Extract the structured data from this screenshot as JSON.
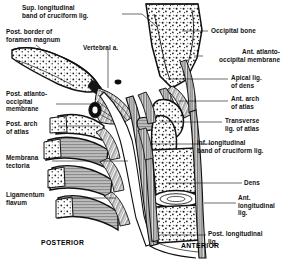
{
  "figure": {
    "orientation": {
      "posterior": "POSTERIOR",
      "anterior": "ANTERIOR"
    },
    "ink_color": "#111111",
    "background_color": "#ffffff"
  },
  "labels_left": [
    {
      "id": "sup-longitudinal-band",
      "text": "Sup. longitudinal\nband of cruciform lig.",
      "x": 22,
      "y": 5,
      "align": "left"
    },
    {
      "id": "post-border-foramen-magnum",
      "text": "Post. border of\nforamen magnum",
      "x": 6,
      "y": 29,
      "align": "left"
    },
    {
      "id": "vertebral-artery",
      "text": "Vertebral a.",
      "x": 83,
      "y": 45,
      "align": "left"
    },
    {
      "id": "post-atlanto-occipital-membrane",
      "text": "Post. atlanto-\noccipital\nmembrane",
      "x": 6,
      "y": 91,
      "align": "left"
    },
    {
      "id": "post-arch-of-atlas",
      "text": "Post. arch\nof atlas",
      "x": 6,
      "y": 121,
      "align": "left"
    },
    {
      "id": "membrana-tectoria",
      "text": "Membrana\ntectoria",
      "x": 6,
      "y": 155,
      "align": "left"
    },
    {
      "id": "ligamentum-flavum",
      "text": "Ligamentum\nflavum",
      "x": 6,
      "y": 192,
      "align": "left"
    }
  ],
  "labels_right": [
    {
      "id": "occipital-bone",
      "text": "Occipital bone",
      "x": 211,
      "y": 27,
      "align": "left"
    },
    {
      "id": "ant-atlanto-occipital-membrane",
      "text": "Ant. atlanto-\noccipital membrane",
      "x": 200,
      "y": 49,
      "align": "right"
    },
    {
      "id": "apical-lig-of-dens",
      "text": "Apical lig.\nof dens",
      "x": 231,
      "y": 75,
      "align": "left"
    },
    {
      "id": "ant-arch-of-atlas",
      "text": "Ant. arch\nof atlas",
      "x": 231,
      "y": 96,
      "align": "left"
    },
    {
      "id": "transverse-lig-of-atlas",
      "text": "Transverse\nlig. of atlas",
      "x": 225,
      "y": 118,
      "align": "left"
    },
    {
      "id": "inf-longitudinal-band",
      "text": "Inf. longitudinal\nband of cruciform lig.",
      "x": 197,
      "y": 140,
      "align": "left"
    },
    {
      "id": "dens",
      "text": "Dens",
      "x": 244,
      "y": 180,
      "align": "left"
    },
    {
      "id": "ant-longitudinal-lig",
      "text": "Ant.\nlongitudinal\nlig.",
      "x": 238,
      "y": 195,
      "align": "left"
    },
    {
      "id": "post-longitudinal-lig",
      "text": "Post. longitudinal\nlig.",
      "x": 208,
      "y": 231,
      "align": "left"
    }
  ],
  "orientation_markers": [
    {
      "id": "posterior-marker",
      "text": "POSTERIOR",
      "x": 41,
      "y": 240
    },
    {
      "id": "anterior-marker",
      "text": "ANTERIOR",
      "x": 181,
      "y": 243
    }
  ],
  "anatomy_regions": [
    {
      "id": "occipital-bone-region",
      "name": "Occipital bone (cancellous, stippled)"
    },
    {
      "id": "atlas-posterior-arch",
      "name": "Posterior arch of atlas"
    },
    {
      "id": "atlas-anterior-arch",
      "name": "Anterior arch of atlas"
    },
    {
      "id": "dens-axis",
      "name": "Dens of axis"
    },
    {
      "id": "axis-body",
      "name": "Body of axis (C2)"
    },
    {
      "id": "c3-vertebral-body",
      "name": "C3 vertebral body"
    },
    {
      "id": "intervertebral-disc",
      "name": "Intervertebral disc"
    },
    {
      "id": "spinal-canal",
      "name": "Vertebral canal / spinal cord space"
    },
    {
      "id": "cruciform-ligament",
      "name": "Cruciform ligament complex"
    },
    {
      "id": "spinous-processes",
      "name": "Cervical spinous processes"
    }
  ]
}
